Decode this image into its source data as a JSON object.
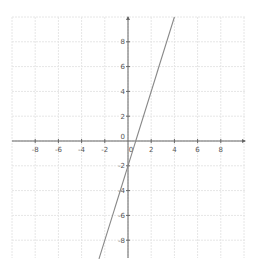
{
  "chart_data": {
    "type": "line",
    "title": "",
    "xlabel": "",
    "ylabel": "",
    "xlim": [
      -10,
      10
    ],
    "ylim": [
      -10,
      10
    ],
    "grid": true,
    "x_ticks": [
      -8,
      -6,
      -4,
      -2,
      0,
      2,
      4,
      6,
      8
    ],
    "y_ticks": [
      -8,
      -6,
      -4,
      -2,
      0,
      2,
      4,
      6,
      8
    ],
    "x_tick_labels": [
      "-8",
      "-6",
      "-4",
      "-2",
      "0",
      "2",
      "4",
      "6",
      "8"
    ],
    "y_tick_labels": [
      "-8",
      "-6",
      "-4",
      "-2",
      "0",
      "2",
      "4",
      "6",
      "8"
    ],
    "series": [
      {
        "name": "y = 3x - 2",
        "slope": 3,
        "intercept": -2,
        "x": [
          -2.5,
          4
        ],
        "y": [
          -9.5,
          10
        ],
        "color": "#888888"
      }
    ]
  },
  "colors": {
    "axis": "#666666",
    "grid": "#e6e6e6",
    "line": "#888888",
    "background": "#ffffff"
  }
}
